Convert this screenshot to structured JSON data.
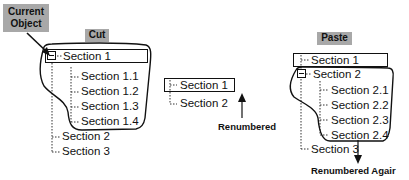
{
  "labels": {
    "current_object": "Current Object",
    "cut": "Cut",
    "paste": "Paste",
    "renumbered": "Renumbered",
    "renumbered_again": "Renumbered Agair"
  },
  "cut_panel": {
    "items": [
      {
        "label": "Section 1",
        "level": 0,
        "selected": true,
        "expanded": true
      },
      {
        "label": "Section 1.1",
        "level": 1
      },
      {
        "label": "Section 1.2",
        "level": 1
      },
      {
        "label": "Section 1.3",
        "level": 1
      },
      {
        "label": "Section 1.4",
        "level": 1
      },
      {
        "label": "Section 2",
        "level": 0
      },
      {
        "label": "Section 3",
        "level": 0
      }
    ]
  },
  "middle_panel": {
    "items": [
      {
        "label": "Section 1",
        "level": 0,
        "selected": true
      },
      {
        "label": "Section 2",
        "level": 0
      }
    ]
  },
  "paste_panel": {
    "items": [
      {
        "label": "Section 1",
        "level": 0,
        "selected": true
      },
      {
        "label": "Section 2",
        "level": 0,
        "expanded": true
      },
      {
        "label": "Section 2.1",
        "level": 1
      },
      {
        "label": "Section 2.2",
        "level": 1
      },
      {
        "label": "Section 2.3",
        "level": 1
      },
      {
        "label": "Section 2.4",
        "level": 1
      },
      {
        "label": "Section 3",
        "level": 0
      }
    ]
  },
  "colors": {
    "tag_background": "#a8a8a8",
    "line": "#111111"
  }
}
